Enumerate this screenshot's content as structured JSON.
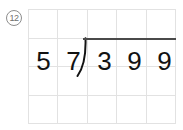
{
  "problem": {
    "number_label": "12",
    "number_icon": "circled-number-icon",
    "operation": "long-division",
    "divisor": "57",
    "dividend": "399",
    "quotient": "",
    "divisor_digits": [
      "5",
      "7"
    ],
    "dividend_digits": [
      "3",
      "9",
      "9"
    ],
    "bracket_glyph": "division-bracket-icon"
  },
  "grid": {
    "columns": 5,
    "rows": 4,
    "line_color": "#e2e2e2",
    "cells": [
      [
        "",
        "",
        "",
        "",
        ""
      ],
      [
        "",
        "",
        "",
        "",
        ""
      ],
      [
        "",
        "",
        "",
        "",
        ""
      ],
      [
        "",
        "",
        "",
        "",
        ""
      ]
    ]
  },
  "colors": {
    "ink": "#121212",
    "rule": "#4a4a4a",
    "grid_line": "#e2e2e2",
    "badge": "#6f6f6f",
    "background": "#ffffff"
  }
}
